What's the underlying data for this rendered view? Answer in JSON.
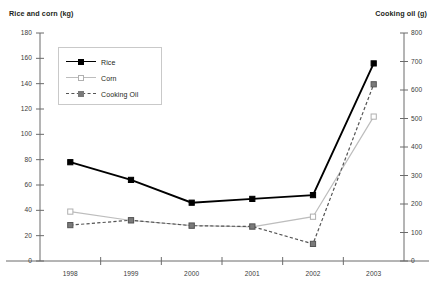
{
  "chart_data": {
    "type": "line",
    "title": "",
    "xlabel": "",
    "categories": [
      "1998",
      "1999",
      "2000",
      "2001",
      "2002",
      "2003"
    ],
    "axes": {
      "left": {
        "label": "Rice and corn (kg)",
        "ylim": [
          0,
          180
        ],
        "tick_step": 20,
        "ticks": [
          "0",
          "20",
          "40",
          "60",
          "80",
          "100",
          "120",
          "140",
          "160",
          "180"
        ]
      },
      "right": {
        "label": "Cooking oil (g)",
        "ylim": [
          0,
          800
        ],
        "tick_step": 100,
        "ticks": [
          "0",
          "100",
          "200",
          "300",
          "400",
          "500",
          "600",
          "700",
          "800"
        ]
      }
    },
    "grid": false,
    "legend_position": "upper-left-inside",
    "series": [
      {
        "name": "Rice",
        "axis": "left",
        "unit": "kg",
        "color": "#000000",
        "line_style": "solid",
        "marker": "filled-square",
        "values": [
          78,
          64,
          46,
          49,
          52,
          156
        ]
      },
      {
        "name": "Corn",
        "axis": "left",
        "unit": "kg",
        "color": "#bdbdbd",
        "line_style": "solid",
        "marker": "open-square",
        "values": [
          39,
          32,
          28,
          27,
          35,
          114
        ]
      },
      {
        "name": "Cooking Oil",
        "axis": "right",
        "unit": "g",
        "color": "#555555",
        "line_style": "dashed",
        "marker": "filled-square",
        "values": [
          126,
          143,
          124,
          121,
          60,
          620
        ]
      }
    ]
  },
  "legend": {
    "items": [
      {
        "label": "Rice"
      },
      {
        "label": "Corn"
      },
      {
        "label": "Cooking Oil"
      }
    ]
  },
  "colors": {
    "rice": "#000000",
    "corn": "#bdbdbd",
    "cooking_oil": "#555555",
    "axis": "#6b6b6b",
    "text": "#231f20"
  }
}
